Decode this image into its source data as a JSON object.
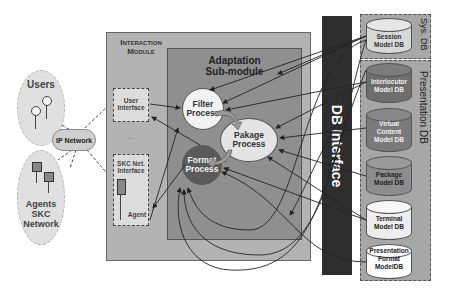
{
  "left": {
    "users_label": "Users",
    "ip_network_label": "IP Network",
    "agents_label_lines": [
      "Agents",
      "SKC",
      "Network"
    ]
  },
  "interaction_module": {
    "title_lines": [
      "Interaction",
      "Module"
    ],
    "user_interface_lines": [
      "User",
      "Interface"
    ],
    "ellipsis": "...",
    "skc_interface_lines": [
      "SKC Net.",
      "Interface"
    ],
    "agent_label": "Agent"
  },
  "adaptation": {
    "title_lines": [
      "Adaptation",
      "Sub-module"
    ],
    "filter_lines": [
      "Filter",
      "Process"
    ],
    "package_lines": [
      "Pakage",
      "Process"
    ],
    "format_lines": [
      "Format",
      "Process"
    ]
  },
  "db_interface": {
    "label": "DB Interface"
  },
  "sys_db": {
    "label": "Sys. DB",
    "items": [
      {
        "lines": [
          "Session",
          "Model DB"
        ],
        "fill": "#d8d8d8",
        "text": "#333333"
      }
    ]
  },
  "presentation_db": {
    "label": "Presentation DB",
    "items": [
      {
        "lines": [
          "Interlocutor",
          "Model DB"
        ],
        "fill": "#6e6e6e",
        "text": "#f0f0f0"
      },
      {
        "lines": [
          "Virtual",
          "Content",
          "Model DB"
        ],
        "fill": "#7a7a7a",
        "text": "#f0f0f0"
      },
      {
        "lines": [
          "Package",
          "Model DB"
        ],
        "fill": "#8d8d8d",
        "text": "#222222"
      },
      {
        "lines": [
          "Terminal",
          "Model DB"
        ],
        "fill": "#eeeeee",
        "text": "#222222"
      },
      {
        "lines": [
          "Presentation",
          "Format",
          "ModelDB"
        ],
        "fill": "#ffffff",
        "text": "#222222"
      }
    ]
  },
  "colors": {
    "interaction_module_bg": "#b3b3b3",
    "adaptation_bg": "#8f8f8f",
    "db_interface_bg": "#2e2e2e",
    "db_group_bg": "#a7a7a7",
    "filter_fill": "#f2f2f2",
    "package_fill": "#e4e4e4",
    "format_fill": "#5a5a5a"
  }
}
